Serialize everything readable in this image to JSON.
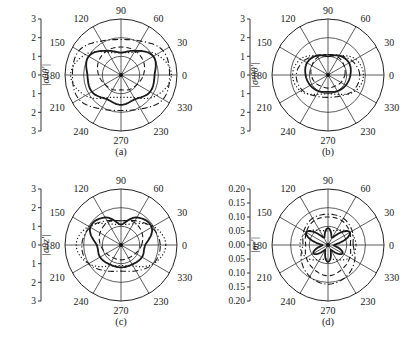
{
  "figure": {
    "panels": [
      "a",
      "b",
      "c",
      "d"
    ]
  },
  "chart_data": [
    {
      "type": "polar",
      "panel": "(a)",
      "ylabel": "|σθθ'|",
      "radial_ticks": [
        "3",
        "2",
        "1",
        "0",
        "1",
        "2",
        "3"
      ],
      "rmax": 3,
      "angle_labels": [
        "0",
        "30",
        "60",
        "90",
        "120",
        "150",
        "180",
        "210",
        "240",
        "270",
        "230",
        "330"
      ],
      "series": [
        {
          "name": "solid",
          "style": "solid",
          "theta": [
            0,
            30,
            60,
            90,
            120,
            150,
            180,
            210,
            240,
            270,
            300,
            330
          ],
          "r": [
            1.8,
            2.0,
            1.5,
            1.2,
            1.5,
            2.0,
            1.8,
            1.8,
            1.5,
            1.6,
            1.5,
            1.8
          ]
        },
        {
          "name": "dashed",
          "style": "dashed",
          "theta": [
            0,
            30,
            60,
            90,
            120,
            150,
            180,
            210,
            240,
            270,
            300,
            330
          ],
          "r": [
            1.2,
            1.4,
            1.5,
            1.5,
            1.5,
            1.4,
            1.2,
            1.0,
            0.9,
            0.8,
            0.9,
            1.0
          ]
        },
        {
          "name": "dotted",
          "style": "dotted",
          "theta": [
            0,
            30,
            60,
            90,
            120,
            150,
            180,
            210,
            240,
            270,
            300,
            330
          ],
          "r": [
            2.7,
            2.2,
            1.4,
            1.2,
            1.4,
            2.2,
            2.7,
            2.2,
            1.4,
            1.2,
            1.4,
            2.2
          ]
        },
        {
          "name": "dash-dot",
          "style": "dashdot",
          "theta": [
            0,
            30,
            60,
            90,
            120,
            150,
            180,
            210,
            240,
            270,
            300,
            330
          ],
          "r": [
            2.6,
            2.6,
            2.1,
            1.9,
            2.1,
            2.6,
            2.6,
            2.6,
            2.1,
            1.9,
            2.1,
            2.6
          ]
        }
      ]
    },
    {
      "type": "polar",
      "panel": "(b)",
      "ylabel": "|σᵖθθ'|",
      "radial_ticks": [
        "3",
        "2",
        "1",
        "0",
        "1",
        "2",
        "3"
      ],
      "rmax": 3,
      "angle_labels": [
        "0",
        "30",
        "60",
        "90",
        "120",
        "150",
        "180",
        "210",
        "240",
        "270",
        "230",
        "330"
      ],
      "series": [
        {
          "name": "solid",
          "style": "solid",
          "theta": [
            0,
            30,
            60,
            90,
            120,
            150,
            180,
            210,
            240,
            270,
            300,
            330
          ],
          "r": [
            1.2,
            1.3,
            1.2,
            1.0,
            1.2,
            1.3,
            1.2,
            1.1,
            1.0,
            0.9,
            1.0,
            1.1
          ]
        },
        {
          "name": "dashed",
          "style": "dashed",
          "theta": [
            0,
            30,
            60,
            90,
            120,
            150,
            180,
            210,
            240,
            270,
            300,
            330
          ],
          "r": [
            0.9,
            1.0,
            1.1,
            1.1,
            1.1,
            1.0,
            0.9,
            0.8,
            0.7,
            0.7,
            0.7,
            0.8
          ]
        },
        {
          "name": "dotted",
          "style": "dotted",
          "theta": [
            0,
            30,
            60,
            90,
            120,
            150,
            180,
            210,
            240,
            270,
            300,
            330
          ],
          "r": [
            1.9,
            1.7,
            1.2,
            1.0,
            1.2,
            1.7,
            1.9,
            1.7,
            1.2,
            1.0,
            1.2,
            1.7
          ]
        },
        {
          "name": "dash-dot",
          "style": "dashdot",
          "theta": [
            0,
            30,
            60,
            90,
            120,
            150,
            180,
            210,
            240,
            270,
            300,
            330
          ],
          "r": [
            1.7,
            1.5,
            1.2,
            1.1,
            1.2,
            1.5,
            1.7,
            1.6,
            1.3,
            1.2,
            1.3,
            1.6
          ]
        }
      ]
    },
    {
      "type": "polar",
      "panel": "(c)",
      "ylabel": "|σθz'|",
      "radial_ticks": [
        "3",
        "2",
        "1",
        "0",
        "1",
        "2",
        "3"
      ],
      "rmax": 3,
      "angle_labels": [
        "0",
        "30",
        "60",
        "90",
        "120",
        "150",
        "180",
        "210",
        "240",
        "270",
        "230",
        "330"
      ],
      "series": [
        {
          "name": "solid",
          "style": "solid",
          "theta": [
            0,
            30,
            60,
            90,
            120,
            150,
            180,
            210,
            240,
            270,
            300,
            330
          ],
          "r": [
            1.3,
            1.9,
            1.7,
            1.1,
            1.7,
            1.9,
            1.3,
            1.3,
            1.2,
            1.2,
            1.2,
            1.3
          ]
        },
        {
          "name": "dashed",
          "style": "dashed",
          "theta": [
            0,
            30,
            60,
            90,
            120,
            150,
            180,
            210,
            240,
            270,
            300,
            330
          ],
          "r": [
            1.1,
            1.3,
            1.4,
            1.3,
            1.4,
            1.3,
            1.1,
            0.9,
            0.8,
            0.8,
            0.8,
            0.9
          ]
        },
        {
          "name": "dotted",
          "style": "dotted",
          "theta": [
            0,
            30,
            60,
            90,
            120,
            150,
            180,
            210,
            240,
            270,
            300,
            330
          ],
          "r": [
            2.4,
            2.0,
            1.3,
            1.1,
            1.3,
            2.0,
            2.4,
            2.0,
            1.3,
            1.1,
            1.3,
            2.0
          ]
        },
        {
          "name": "dash-dot",
          "style": "dashdot",
          "theta": [
            0,
            30,
            60,
            90,
            120,
            150,
            180,
            210,
            240,
            270,
            300,
            330
          ],
          "r": [
            2.1,
            1.9,
            1.5,
            1.3,
            1.5,
            1.9,
            2.1,
            2.0,
            1.6,
            1.4,
            1.6,
            2.0
          ]
        }
      ]
    },
    {
      "type": "polar",
      "panel": "(d)",
      "ylabel": "|σr'|",
      "radial_ticks": [
        "0.20",
        "0.15",
        "0.10",
        "0.05",
        "0.00",
        "0.05",
        "0.10",
        "0.15",
        "0.20"
      ],
      "rmax": 0.2,
      "angle_labels": [
        "0",
        "30",
        "60",
        "90",
        "120",
        "150",
        "180",
        "210",
        "240",
        "270",
        "230",
        "330"
      ],
      "series": [
        {
          "name": "solid",
          "style": "solid",
          "theta": [
            0,
            30,
            60,
            90,
            120,
            150,
            180,
            210,
            240,
            270,
            300,
            330
          ],
          "r": [
            0.02,
            0.09,
            0.03,
            0.06,
            0.03,
            0.09,
            0.02,
            0.06,
            0.02,
            0.06,
            0.02,
            0.06
          ]
        },
        {
          "name": "dashed",
          "style": "dashed",
          "theta": [
            0,
            30,
            60,
            90,
            120,
            150,
            180,
            210,
            240,
            270,
            300,
            330
          ],
          "r": [
            0.08,
            0.09,
            0.1,
            0.1,
            0.1,
            0.09,
            0.08,
            0.09,
            0.1,
            0.11,
            0.1,
            0.09
          ]
        },
        {
          "name": "dotted",
          "style": "dotted",
          "theta": [
            0,
            30,
            60,
            90,
            120,
            150,
            180,
            210,
            240,
            270,
            300,
            330
          ],
          "r": [
            0.1,
            0.09,
            0.06,
            0.05,
            0.06,
            0.09,
            0.1,
            0.09,
            0.06,
            0.05,
            0.06,
            0.09
          ]
        },
        {
          "name": "dash-dot",
          "style": "dashdot",
          "theta": [
            0,
            30,
            60,
            90,
            120,
            150,
            180,
            210,
            240,
            270,
            300,
            330
          ],
          "r": [
            0.09,
            0.1,
            0.11,
            0.11,
            0.11,
            0.1,
            0.09,
            0.11,
            0.13,
            0.14,
            0.13,
            0.11
          ]
        }
      ]
    }
  ]
}
